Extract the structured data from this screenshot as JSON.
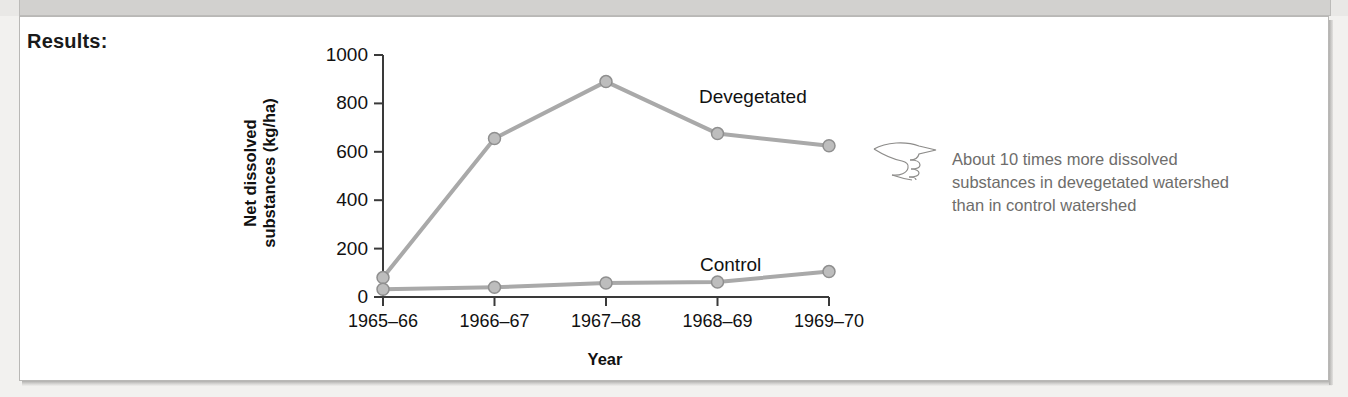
{
  "banner": {
    "title": "Prediction of null hypothesis"
  },
  "section": {
    "results_label": "Results:"
  },
  "annotation": {
    "icon": "pointing-hand-icon",
    "lines": [
      "About 10 times more dissolved",
      "substances in devegetated watershed",
      "than in control watershed"
    ]
  },
  "colors": {
    "line": "#a9a9a9",
    "marker_fill": "#bdbdbd",
    "marker_stroke": "#8f8f8f",
    "axis": "#3a3a3a",
    "text": "#111111",
    "annotation_text": "#6e6d6b",
    "panel_bg": "#ffffff",
    "page_bg": "#f2f1ef"
  },
  "chart_data": {
    "type": "line",
    "title": "",
    "xlabel": "Year",
    "ylabel": "Net dissolved substances (kg/ha)",
    "ylabel_line1": "Net dissolved",
    "ylabel_line2": "substances (kg/ha)",
    "categories": [
      "1965–66",
      "1966–67",
      "1967–68",
      "1968–69",
      "1969–70"
    ],
    "ylim": [
      0,
      1000
    ],
    "yticks": [
      0,
      200,
      400,
      600,
      800,
      1000
    ],
    "ytick_labels": [
      "0",
      "200",
      "400",
      "600",
      "800",
      "1000"
    ],
    "grid": false,
    "legend": "inline-labels",
    "series": [
      {
        "name": "Devegetated",
        "values": [
          80,
          655,
          890,
          675,
          625
        ]
      },
      {
        "name": "Control",
        "values": [
          32,
          40,
          58,
          62,
          105
        ]
      }
    ]
  }
}
